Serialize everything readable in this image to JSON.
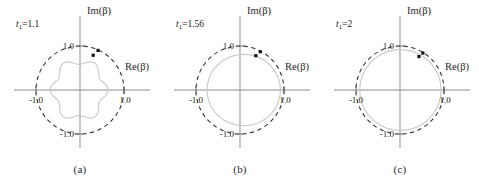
{
  "figure": {
    "title": "",
    "panel_count": 3
  },
  "chart_data": {
    "type": "scatter",
    "title": "",
    "xlabel": "Re(β)",
    "ylabel": "Im(β)",
    "xlim": [
      -1.35,
      1.35
    ],
    "ylim": [
      -1.35,
      1.35
    ],
    "grid": false,
    "legend": "none",
    "tick_labels": {
      "x": [
        "-1.0",
        "1.0"
      ],
      "y": [
        "1.0",
        "-1.0"
      ]
    },
    "tick_values": {
      "x": [
        -1.0,
        1.0
      ],
      "y": [
        1.0,
        -1.0
      ]
    },
    "reference_curve": {
      "name": "unit-circle",
      "style": "dashed",
      "radius": 1.0,
      "color": "#2b2b2b"
    },
    "panels": [
      {
        "id": "a",
        "caption": "(a)",
        "param_label": "t₁=1.1",
        "param_name": "t₁",
        "param_value": "1.1",
        "inner_curve": {
          "name": "beta-locus",
          "style": "solid",
          "color": "#c9c9c9",
          "description": "scalloped closed curve with lobes",
          "mean_radius": 0.62,
          "lobe_amplitude": 0.07,
          "lobe_count": 6,
          "center": [
            -0.02,
            0.0
          ]
        },
        "points": [
          {
            "re": 0.41,
            "im": 0.9,
            "label": ""
          },
          {
            "re": 0.3,
            "im": 0.79,
            "label": ""
          }
        ]
      },
      {
        "id": "b",
        "caption": "(b)",
        "param_label": "t₁=1.56",
        "param_name": "t₁",
        "param_value": "1.56",
        "inner_curve": {
          "name": "beta-locus",
          "style": "solid",
          "color": "#c9c9c9",
          "description": "smooth oval flattened on the left",
          "mean_radius": 0.82,
          "lobe_amplitude": 0.05,
          "lobe_count": 1,
          "center": [
            0.04,
            0.0
          ]
        },
        "points": [
          {
            "re": 0.46,
            "im": 0.87,
            "label": ""
          },
          {
            "re": 0.36,
            "im": 0.78,
            "label": ""
          }
        ]
      },
      {
        "id": "c",
        "caption": "(c)",
        "param_label": "t₁=2",
        "param_name": "t₁",
        "param_value": "2",
        "inner_curve": {
          "name": "beta-locus",
          "style": "solid",
          "color": "#c9c9c9",
          "description": "near perfect circle",
          "mean_radius": 0.92,
          "lobe_amplitude": 0.01,
          "lobe_count": 1,
          "center": [
            0.0,
            0.0
          ]
        },
        "points": [
          {
            "re": 0.52,
            "im": 0.84,
            "label": ""
          },
          {
            "re": 0.43,
            "im": 0.76,
            "label": ""
          }
        ]
      }
    ]
  }
}
